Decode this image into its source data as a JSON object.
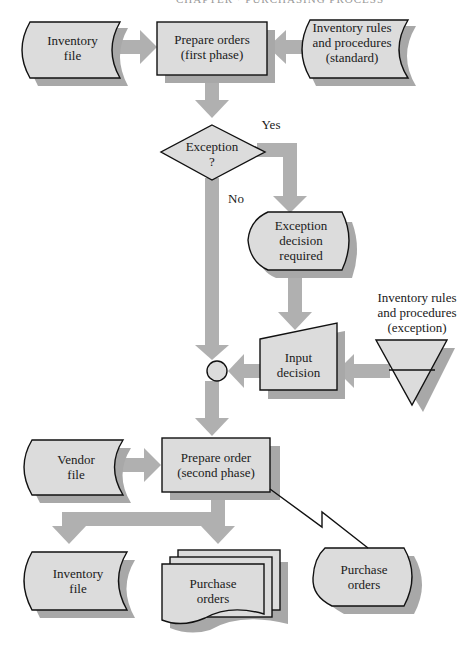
{
  "header": {
    "running_head": "CHAPTER · PURCHASING PROCESS"
  },
  "colors": {
    "shape_fill": "#dcdcdc",
    "shape_stroke": "#111111",
    "shadow": "#a8a8a8",
    "arrow": "#b0b0b0",
    "text": "#1a1a1a"
  },
  "nodes": {
    "inventory_file_top": {
      "label_1": "Inventory",
      "label_2": "file",
      "type": "online-storage"
    },
    "prepare_orders_first": {
      "label_1": "Prepare orders",
      "label_2": "(first phase)",
      "type": "process"
    },
    "rules_standard": {
      "label_1": "Inventory rules",
      "label_2": "and procedures",
      "label_3": "(standard)",
      "type": "online-storage"
    },
    "exception_decision": {
      "label_1": "Exception",
      "label_2": "?",
      "type": "decision"
    },
    "exception_required": {
      "label_1": "Exception",
      "label_2": "decision",
      "label_3": "required",
      "type": "display"
    },
    "input_decision": {
      "label_1": "Input",
      "label_2": "decision",
      "type": "manual-input"
    },
    "rules_exception": {
      "label_1": "Inventory rules",
      "label_2": "and procedures",
      "label_3": "(exception)",
      "type": "offline-storage"
    },
    "connector": {
      "type": "connector"
    },
    "vendor_file": {
      "label_1": "Vendor",
      "label_2": "file",
      "type": "online-storage"
    },
    "prepare_order_second": {
      "label_1": "Prepare order",
      "label_2": "(second phase)",
      "type": "process"
    },
    "inventory_file_bottom": {
      "label_1": "Inventory",
      "label_2": "file",
      "type": "online-storage"
    },
    "purchase_orders_docs": {
      "label_1": "Purchase",
      "label_2": "orders",
      "type": "multi-document"
    },
    "purchase_orders_display": {
      "label_1": "Purchase",
      "label_2": "orders",
      "type": "display"
    }
  },
  "edges": {
    "yes_label": "Yes",
    "no_label": "No"
  }
}
